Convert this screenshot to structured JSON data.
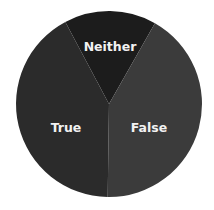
{
  "chart_data": {
    "type": "pie",
    "title": "",
    "categories": [
      "True",
      "False",
      "Neither"
    ],
    "values": [
      42,
      42,
      16
    ],
    "colors": [
      "#2b2b2b",
      "#3b3b3b",
      "#1c1c1c"
    ],
    "legend": "none (labels placed on slices)",
    "start_angle_deg": -28,
    "center": [
      109,
      104
    ],
    "radius": 93
  },
  "labels": {
    "true": "True",
    "false": "False",
    "neither": "Neither"
  },
  "colors": {
    "background": "#ffffff",
    "label_text": "#f2f2f2"
  }
}
